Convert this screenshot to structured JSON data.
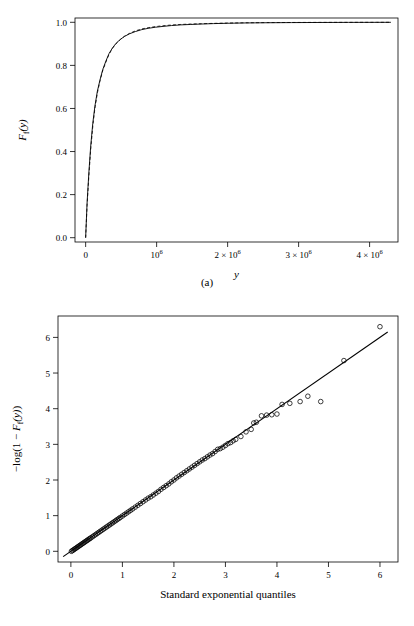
{
  "figure": {
    "panels": [
      {
        "id": "a",
        "caption": "(a)"
      },
      {
        "id": "b",
        "caption": "(b)"
      }
    ]
  },
  "chart_data": [
    {
      "type": "line",
      "panel": "(a)",
      "title": "",
      "xlabel": "y",
      "ylabel": "F_f(y)",
      "xlim": [
        -150000,
        4400000
      ],
      "ylim": [
        -0.02,
        1.02
      ],
      "grid": false,
      "legend": null,
      "xticks": [
        0,
        1000000,
        2000000,
        3000000,
        4000000
      ],
      "xticklabels": [
        "0",
        "10^6",
        "2 × 10^6",
        "3 × 10^6",
        "4 × 10^6"
      ],
      "yticks": [
        0.0,
        0.2,
        0.4,
        0.6,
        0.8,
        1.0
      ],
      "yticklabels": [
        "0.0",
        "0.2",
        "0.4",
        "0.6",
        "0.8",
        "1.0"
      ],
      "series": [
        {
          "name": "empirical",
          "style": "solid",
          "x": [
            0,
            20000,
            45000,
            70000,
            100000,
            130000,
            165000,
            200000,
            240000,
            285000,
            330000,
            380000,
            430000,
            490000,
            550000,
            620000,
            700000,
            790000,
            880000,
            980000,
            1090000,
            1210000,
            1340000,
            1480000,
            1630000,
            1800000,
            2000000,
            2250000,
            2550000,
            2900000,
            3300000,
            3700000,
            4100000,
            4300000
          ],
          "y": [
            0.0,
            0.16,
            0.3,
            0.42,
            0.53,
            0.61,
            0.68,
            0.73,
            0.78,
            0.82,
            0.855,
            0.882,
            0.903,
            0.921,
            0.935,
            0.947,
            0.957,
            0.966,
            0.972,
            0.977,
            0.981,
            0.985,
            0.988,
            0.99,
            0.992,
            0.994,
            0.9955,
            0.997,
            0.998,
            0.9987,
            0.9992,
            0.9996,
            0.9999,
            1.0
          ]
        },
        {
          "name": "fitted",
          "style": "dashed",
          "x": [
            0,
            20000,
            45000,
            70000,
            100000,
            130000,
            165000,
            200000,
            240000,
            285000,
            330000,
            380000,
            430000,
            490000,
            550000,
            620000,
            700000,
            790000,
            880000,
            980000,
            1090000,
            1210000,
            1340000,
            1480000,
            1630000,
            1800000,
            2000000,
            2250000,
            2550000,
            2900000,
            3300000,
            3700000,
            4100000,
            4300000
          ],
          "y": [
            0.0,
            0.15,
            0.285,
            0.405,
            0.515,
            0.6,
            0.672,
            0.725,
            0.775,
            0.815,
            0.852,
            0.88,
            0.901,
            0.92,
            0.936,
            0.949,
            0.96,
            0.969,
            0.975,
            0.98,
            0.984,
            0.9875,
            0.99,
            0.992,
            0.9935,
            0.995,
            0.9965,
            0.9978,
            0.9987,
            0.9992,
            0.9996,
            0.9998,
            0.9999,
            1.0
          ]
        }
      ]
    },
    {
      "type": "scatter",
      "panel": "(b)",
      "title": "",
      "xlabel": "Standard exponential quantiles",
      "ylabel": "−log(1 − F_f(y))",
      "xlim": [
        -0.25,
        6.35
      ],
      "ylim": [
        -0.3,
        6.6
      ],
      "grid": false,
      "legend": null,
      "xticks": [
        0,
        1,
        2,
        3,
        4,
        5,
        6
      ],
      "xticklabels": [
        "0",
        "1",
        "2",
        "3",
        "4",
        "5",
        "6"
      ],
      "yticks": [
        0,
        1,
        2,
        3,
        4,
        5,
        6
      ],
      "yticklabels": [
        "0",
        "1",
        "2",
        "3",
        "4",
        "5",
        "6"
      ],
      "reference_line": {
        "name": "y = x",
        "slope": 1.0,
        "intercept": 0.0,
        "x_from": -0.15,
        "x_to": 6.15
      },
      "points": [
        [
          0.01,
          0.0
        ],
        [
          0.03,
          0.02
        ],
        [
          0.05,
          0.04
        ],
        [
          0.07,
          0.06
        ],
        [
          0.09,
          0.08
        ],
        [
          0.11,
          0.1
        ],
        [
          0.13,
          0.12
        ],
        [
          0.15,
          0.14
        ],
        [
          0.17,
          0.16
        ],
        [
          0.19,
          0.18
        ],
        [
          0.21,
          0.2
        ],
        [
          0.23,
          0.22
        ],
        [
          0.25,
          0.24
        ],
        [
          0.27,
          0.26
        ],
        [
          0.29,
          0.28
        ],
        [
          0.31,
          0.3
        ],
        [
          0.33,
          0.32
        ],
        [
          0.35,
          0.34
        ],
        [
          0.37,
          0.36
        ],
        [
          0.39,
          0.38
        ],
        [
          0.42,
          0.41
        ],
        [
          0.45,
          0.44
        ],
        [
          0.48,
          0.47
        ],
        [
          0.51,
          0.5
        ],
        [
          0.54,
          0.53
        ],
        [
          0.57,
          0.56
        ],
        [
          0.6,
          0.59
        ],
        [
          0.63,
          0.62
        ],
        [
          0.66,
          0.65
        ],
        [
          0.69,
          0.68
        ],
        [
          0.72,
          0.71
        ],
        [
          0.75,
          0.74
        ],
        [
          0.78,
          0.77
        ],
        [
          0.81,
          0.8
        ],
        [
          0.84,
          0.83
        ],
        [
          0.87,
          0.86
        ],
        [
          0.9,
          0.89
        ],
        [
          0.93,
          0.92
        ],
        [
          0.96,
          0.95
        ],
        [
          1.0,
          0.99
        ],
        [
          1.04,
          1.03
        ],
        [
          1.08,
          1.07
        ],
        [
          1.12,
          1.11
        ],
        [
          1.16,
          1.15
        ],
        [
          1.2,
          1.19
        ],
        [
          1.25,
          1.24
        ],
        [
          1.3,
          1.29
        ],
        [
          1.35,
          1.34
        ],
        [
          1.4,
          1.39
        ],
        [
          1.45,
          1.44
        ],
        [
          1.5,
          1.49
        ],
        [
          1.55,
          1.53
        ],
        [
          1.6,
          1.58
        ],
        [
          1.65,
          1.63
        ],
        [
          1.7,
          1.68
        ],
        [
          1.75,
          1.74
        ],
        [
          1.8,
          1.79
        ],
        [
          1.85,
          1.84
        ],
        [
          1.9,
          1.89
        ],
        [
          1.95,
          1.95
        ],
        [
          2.0,
          2.0
        ],
        [
          2.05,
          2.06
        ],
        [
          2.1,
          2.11
        ],
        [
          2.15,
          2.16
        ],
        [
          2.2,
          2.21
        ],
        [
          2.25,
          2.26
        ],
        [
          2.3,
          2.31
        ],
        [
          2.35,
          2.36
        ],
        [
          2.4,
          2.41
        ],
        [
          2.45,
          2.46
        ],
        [
          2.5,
          2.51
        ],
        [
          2.55,
          2.56
        ],
        [
          2.6,
          2.6
        ],
        [
          2.65,
          2.65
        ],
        [
          2.7,
          2.7
        ],
        [
          2.75,
          2.74
        ],
        [
          2.8,
          2.8
        ],
        [
          2.85,
          2.86
        ],
        [
          2.9,
          2.88
        ],
        [
          2.95,
          2.92
        ],
        [
          3.0,
          2.97
        ],
        [
          3.05,
          3.02
        ],
        [
          3.1,
          3.05
        ],
        [
          3.15,
          3.1
        ],
        [
          3.2,
          3.14
        ],
        [
          3.3,
          3.22
        ],
        [
          3.4,
          3.35
        ],
        [
          3.5,
          3.42
        ],
        [
          3.55,
          3.6
        ],
        [
          3.6,
          3.62
        ],
        [
          3.7,
          3.8
        ],
        [
          3.8,
          3.82
        ],
        [
          3.9,
          3.83
        ],
        [
          4.0,
          3.85
        ],
        [
          4.1,
          4.12
        ],
        [
          4.25,
          4.15
        ],
        [
          4.45,
          4.2
        ],
        [
          4.6,
          4.35
        ],
        [
          4.85,
          4.2
        ],
        [
          5.3,
          5.35
        ],
        [
          6.0,
          6.3
        ]
      ]
    }
  ]
}
